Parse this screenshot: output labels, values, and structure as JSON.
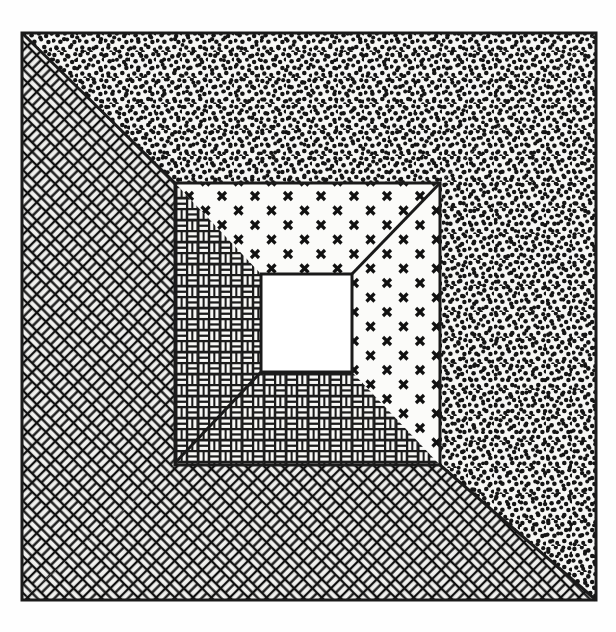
{
  "page": {
    "background_color": "#fefefe",
    "ink_color": "#1a1a1a",
    "width": 616,
    "height": 632
  },
  "header": {
    "rule_label": "horizontal-rule",
    "page_mark_label": "cropped-page-number-mark",
    "rule_color": "#2b2b2b"
  },
  "figure": {
    "caption": "",
    "title": "",
    "description": "Nested square frame diagram with four mitered bands of different hatch patterns surrounding a blank central square",
    "outer_frame": {
      "x1": 22,
      "y1": 33,
      "x2": 596,
      "y2": 600,
      "stroke_color": "#1a1a1a",
      "stroke_width": 3
    },
    "inner_frame": {
      "x1": 175,
      "y1": 183,
      "x2": 440,
      "y2": 465,
      "stroke_color": "#1a1a1a",
      "stroke_width": 3
    },
    "center_square": {
      "x1": 261,
      "y1": 274,
      "x2": 352,
      "y2": 372,
      "fill": "#ffffff",
      "label": "blank-center"
    },
    "regions": [
      {
        "id": "outer-top",
        "name": "outer-top-band",
        "pattern": "stipple-dots",
        "pattern_label": "dense random dot stipple",
        "fill_density": "heavy"
      },
      {
        "id": "outer-right",
        "name": "outer-right-band",
        "pattern": "stipple-dots",
        "pattern_label": "dense random dot stipple",
        "fill_density": "heavy"
      },
      {
        "id": "outer-left",
        "name": "outer-left-band",
        "pattern": "herringbone-dark",
        "pattern_label": "dark diagonal herringbone brick",
        "fill_density": "heavy"
      },
      {
        "id": "outer-bottom",
        "name": "outer-bottom-band",
        "pattern": "herringbone-dark",
        "pattern_label": "dark diagonal herringbone brick",
        "fill_density": "heavy"
      },
      {
        "id": "inner-top",
        "name": "inner-top-band",
        "pattern": "cross-x",
        "pattern_label": "sparse x / cross marks",
        "fill_density": "light"
      },
      {
        "id": "inner-right",
        "name": "inner-right-band",
        "pattern": "cross-x",
        "pattern_label": "sparse x / cross marks",
        "fill_density": "light"
      },
      {
        "id": "inner-left",
        "name": "inner-left-band",
        "pattern": "basketweave-brick",
        "pattern_label": "fine light basketweave brickwork",
        "fill_density": "light"
      },
      {
        "id": "inner-bottom",
        "name": "inner-bottom-band",
        "pattern": "basketweave-brick",
        "pattern_label": "fine light basketweave brickwork",
        "fill_density": "light"
      }
    ],
    "miter_lines": [
      {
        "name": "outer-top-left-miter",
        "x1": 22,
        "y1": 33,
        "x2": 175,
        "y2": 183
      },
      {
        "name": "outer-bottom-right-miter",
        "x1": 440,
        "y1": 465,
        "x2": 596,
        "y2": 600
      },
      {
        "name": "inner-top-right-miter",
        "x1": 440,
        "y1": 183,
        "x2": 352,
        "y2": 274
      },
      {
        "name": "inner-bottom-left-miter",
        "x1": 175,
        "y1": 463,
        "x2": 261,
        "y2": 372
      }
    ]
  }
}
